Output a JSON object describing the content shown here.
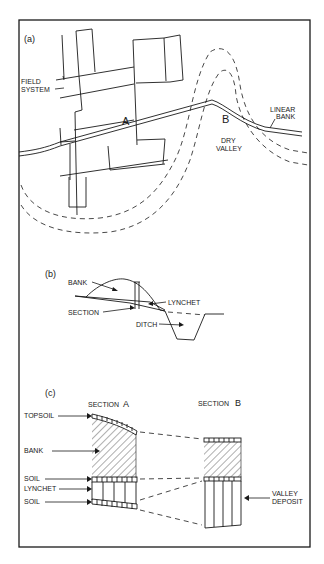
{
  "figure": {
    "panel_a": {
      "label": "(a)",
      "field_system": "FIELD",
      "field_system_2": "SYSTEM",
      "point_a": "A",
      "point_b": "B",
      "linear_bank": "LINEAR",
      "linear_bank_2": "BANK",
      "dry_valley": "DRY",
      "dry_valley_2": "VALLEY"
    },
    "panel_b": {
      "label": "(b)",
      "bank": "BANK",
      "lynchet": "LYNCHET",
      "section": "SECTION",
      "ditch": "DITCH"
    },
    "panel_c": {
      "label": "(c)",
      "section_a": "SECTION",
      "section_a_letter": "A",
      "section_b": "SECTION",
      "section_b_letter": "B",
      "topsoil": "TOPSOIL",
      "bank": "BANK",
      "soil_upper": "SOIL",
      "lynchet": "LYNCHET",
      "soil_lower": "SOIL",
      "valley": "VALLEY",
      "deposit": "DEPOSIT"
    }
  }
}
